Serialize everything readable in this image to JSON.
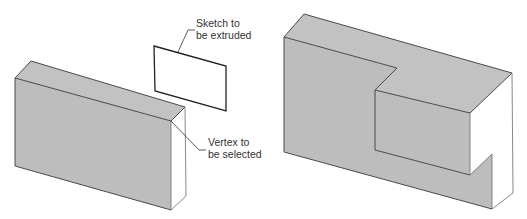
{
  "figure_left": {
    "title": "Block before extrusion",
    "callouts": [
      {
        "id": "sketch",
        "lines": [
          "Sketch to",
          "be extruded"
        ]
      },
      {
        "id": "vertex",
        "lines": [
          "Vertex to",
          "be selected"
        ]
      }
    ]
  },
  "figure_right": {
    "title": "Block after extrude-to-vertex"
  },
  "colors": {
    "face_front": "#bdbdbd",
    "face_top": "#c2c2c2",
    "face_side": "#ffffff",
    "edge": "#4a4a4a"
  }
}
